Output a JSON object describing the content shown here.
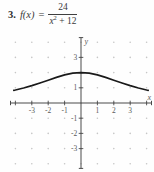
{
  "problem": {
    "number": "3.",
    "function_lhs": "f(x)",
    "equals": "=",
    "numerator": "24",
    "denominator_variable": "x",
    "denominator_exponent": "2",
    "denominator_rest": "+ 12"
  },
  "chart_data": {
    "type": "line",
    "function": "f(x) = 24/(x^2 + 12)",
    "xlabel": "x",
    "ylabel": "y",
    "xlim": [
      -4.3,
      4.3
    ],
    "ylim": [
      -4.3,
      4.3
    ],
    "grid": "dotted integer lattice from -4 to 4",
    "x_ticks": [
      -4,
      -3,
      -2,
      -1,
      1,
      2,
      3,
      4
    ],
    "x_tick_labels": [
      {
        "v": -3,
        "t": "-3"
      },
      {
        "v": -2,
        "t": "-2"
      },
      {
        "v": -1,
        "t": "-1"
      },
      {
        "v": 1,
        "t": "1"
      },
      {
        "v": 2,
        "t": "2"
      },
      {
        "v": 3,
        "t": "3"
      }
    ],
    "y_ticks": [
      -3,
      -2,
      -1,
      1,
      2,
      3
    ],
    "y_tick_labels": [
      {
        "v": 3,
        "t": "3"
      },
      {
        "v": 1,
        "t": "1"
      },
      {
        "v": -1,
        "t": "-1"
      },
      {
        "v": -2,
        "t": "-2"
      },
      {
        "v": -3,
        "t": "-3"
      }
    ],
    "key_points": {
      "x": [
        -4,
        -3,
        -2,
        -1,
        0,
        1,
        2,
        3,
        4
      ],
      "y": [
        0.857,
        1.143,
        1.5,
        1.846,
        2,
        1.846,
        1.5,
        1.143,
        0.857
      ]
    },
    "series": [
      {
        "name": "f(x) = 24/(x^2+12)",
        "x": [
          -4.1,
          -4,
          -3.5,
          -3,
          -2.5,
          -2,
          -1.5,
          -1,
          -0.5,
          0,
          0.5,
          1,
          1.5,
          2,
          2.5,
          3,
          3.5,
          4,
          4.1
        ],
        "y": [
          0.833,
          0.857,
          0.99,
          1.143,
          1.315,
          1.5,
          1.684,
          1.846,
          1.959,
          2,
          1.959,
          1.846,
          1.684,
          1.5,
          1.315,
          1.143,
          0.99,
          0.857,
          0.833
        ]
      }
    ],
    "colors": {
      "curve": "#1a1a1a",
      "axis": "#4a4a4a",
      "tick_label": "#5a5a5a",
      "grid_dot": "#c6c6c6"
    }
  }
}
